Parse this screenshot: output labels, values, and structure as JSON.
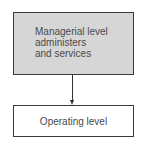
{
  "diagram": {
    "nodes": [
      {
        "id": "managerial",
        "lines": [
          "Managerial level",
          "administers",
          "and services"
        ],
        "fill": "#d6d6d6"
      },
      {
        "id": "operating",
        "label": "Operating level",
        "fill": "#ffffff"
      }
    ],
    "edges": [
      {
        "from": "managerial",
        "to": "operating",
        "type": "arrow"
      }
    ]
  }
}
